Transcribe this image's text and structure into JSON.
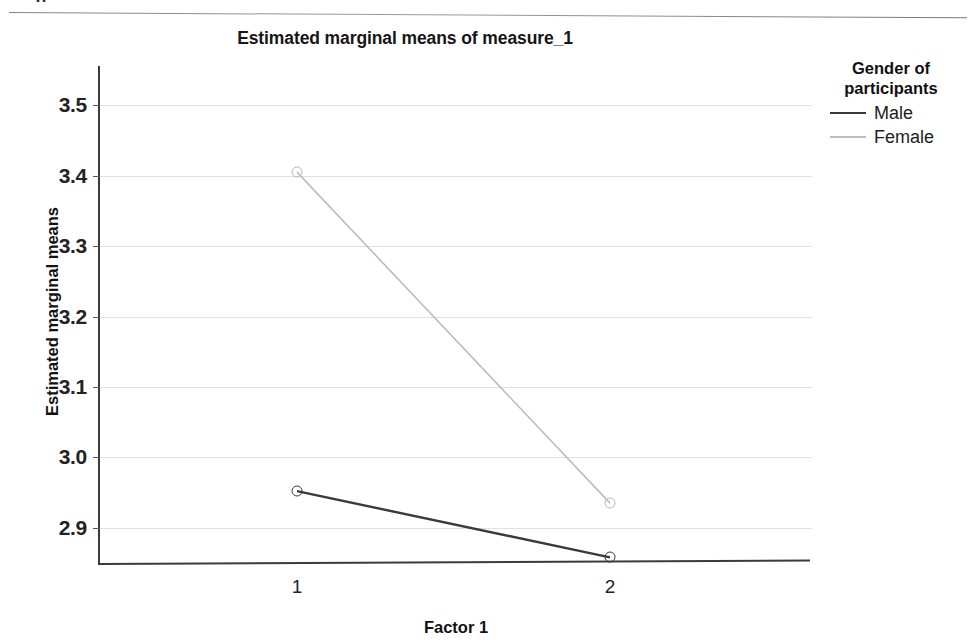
{
  "scan": {
    "top_fragment": "g",
    "top_fragment_right": ","
  },
  "chart_data": {
    "type": "line",
    "title": "Estimated marginal means of measure_1",
    "xlabel": "Factor 1",
    "ylabel": "Estimated marginal means",
    "categories": [
      "1",
      "2"
    ],
    "x": [
      1,
      2
    ],
    "ylim": [
      2.85,
      3.55
    ],
    "yticks": [
      "2.9",
      "3.0",
      "3.1",
      "3.2",
      "3.3",
      "3.4",
      "3.5"
    ],
    "ytick_values": [
      2.9,
      3.0,
      3.1,
      3.2,
      3.3,
      3.4,
      3.5
    ],
    "grid": true,
    "legend_position": "right",
    "legend_title": "Gender of participants",
    "series": [
      {
        "name": "Male",
        "values": [
          2.952,
          2.858
        ],
        "color": "#3a3a3a",
        "marker": "circle-open"
      },
      {
        "name": "Female",
        "values": [
          3.405,
          2.935
        ],
        "color": "#b9b9b9",
        "marker": "circle-open"
      }
    ]
  },
  "legend": {
    "title_line_1": "Gender of",
    "title_line_2": "participants",
    "entries": [
      {
        "label": "Male",
        "color": "#3a3a3a",
        "width": "2.6px"
      },
      {
        "label": "Female",
        "color": "#bdbdbd",
        "width": "2.2px"
      }
    ]
  }
}
